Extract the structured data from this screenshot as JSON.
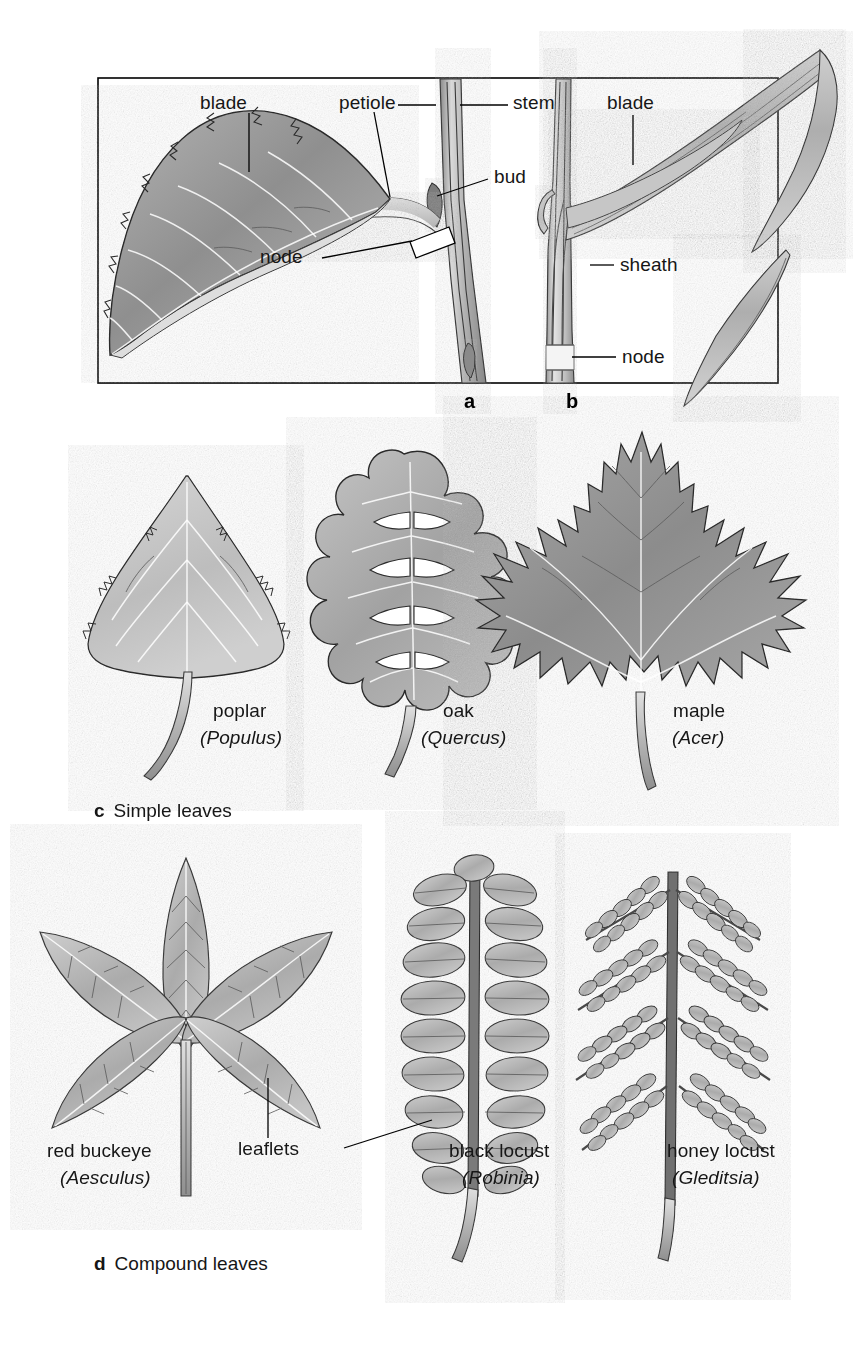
{
  "figure": {
    "panels": [
      {
        "id": "a",
        "letter": "a",
        "description": "Dicot leaf attached to woody stem",
        "labels": [
          {
            "name": "blade",
            "text": "blade"
          },
          {
            "name": "petiole",
            "text": "petiole"
          },
          {
            "name": "stem",
            "text": "stem"
          },
          {
            "name": "bud",
            "text": "bud"
          },
          {
            "name": "node",
            "text": "node"
          }
        ]
      },
      {
        "id": "b",
        "letter": "b",
        "description": "Monocot grass leaf attached to stem",
        "labels": [
          {
            "name": "blade",
            "text": "blade"
          },
          {
            "name": "sheath",
            "text": "sheath"
          },
          {
            "name": "node",
            "text": "node"
          }
        ]
      }
    ],
    "simple_leaves": {
      "letter": "c",
      "caption": "Simple leaves",
      "items": [
        {
          "common": "poplar",
          "latin": "(Populus)"
        },
        {
          "common": "oak",
          "latin": "(Quercus)"
        },
        {
          "common": "maple",
          "latin": "(Acer)"
        }
      ]
    },
    "compound_leaves": {
      "letter": "d",
      "caption": "Compound leaves",
      "callout": "leaflets",
      "items": [
        {
          "common": "red buckeye",
          "latin": "(Aesculus)"
        },
        {
          "common": "black locust",
          "latin": "(Robinia)"
        },
        {
          "common": "honey locust",
          "latin": "(Gleditsia)"
        }
      ]
    },
    "colors": {
      "background": "#ffffff",
      "ink": "#161616",
      "outline": "#2c2c2c",
      "leaf_fill_mid": "#9a9a9a",
      "leaf_fill_light": "#c9c9c9",
      "frame": "#000000"
    }
  }
}
